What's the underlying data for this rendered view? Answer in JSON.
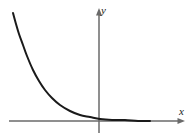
{
  "figure": {
    "background_color": "#ffffff",
    "width": 195,
    "height": 138,
    "axis_color": "#6a6a6a",
    "curve_color": "#1a1a1a",
    "axis_stroke_width": 1.5,
    "curve_stroke_width": 2
  },
  "axes": {
    "x_label": "x",
    "y_label": "y",
    "x_axis": {
      "start_x": 9,
      "end_x": 185,
      "y": 121,
      "has_arrowhead": true,
      "arrow_end": "right"
    },
    "y_axis": {
      "x": 99,
      "start_y": 133,
      "end_y": 8,
      "has_arrowhead": true,
      "arrow_end": "top"
    }
  },
  "chart_data": {
    "type": "line",
    "title": "",
    "subtitle": "",
    "xlabel": "x",
    "ylabel": "y",
    "grid": false,
    "legend": null,
    "legend_position": "none",
    "function": "y = a * e^(-kx), a > 0, k > 0",
    "asymptote": "y = 0 (the x-axis)",
    "xlim": [
      -86,
      86
    ],
    "ylim": [
      -12,
      113
    ],
    "series": [
      {
        "name": "exponential decay",
        "color": "#1a1a1a",
        "x": [
          13,
          16,
          19,
          23,
          27,
          33,
          39,
          45,
          52,
          60,
          70,
          80,
          90,
          100,
          112,
          125,
          138,
          150
        ],
        "y": [
          13,
          24,
          34,
          45,
          56,
          70,
          81,
          90,
          98,
          105,
          111,
          115,
          117,
          119,
          120,
          120,
          121,
          121
        ],
        "x_data": [
          -86,
          -83,
          -80,
          -76,
          -72,
          -66,
          -60,
          -54,
          -47,
          -39,
          -29,
          -19,
          -9,
          1,
          13,
          26,
          39,
          51
        ],
        "y_data": [
          108,
          97,
          87,
          76,
          65,
          51,
          40,
          31,
          23,
          16,
          10,
          6,
          4,
          2,
          1,
          1,
          0,
          0
        ]
      }
    ],
    "annotations": [
      {
        "text": "y",
        "x_px": 101,
        "y_px": 11,
        "style": "italic"
      },
      {
        "text": "x",
        "x_px": 179,
        "y_px": 112,
        "style": "italic"
      }
    ]
  }
}
